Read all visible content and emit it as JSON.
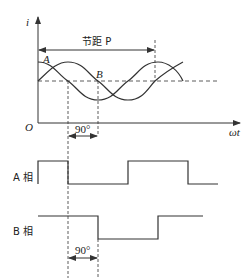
{
  "diagram": {
    "waveform_plot": {
      "y_axis_label": "i",
      "x_axis_label": "ωt",
      "origin_label": "O",
      "pitch_label": "节距 P",
      "curve_a_label": "A",
      "curve_b_label": "B",
      "phase_shift_label": "90°"
    },
    "square_waves": {
      "phase_a_label": "A 相",
      "phase_b_label": "B 相",
      "phase_shift_label": "90°"
    },
    "colors": {
      "line": "#333333",
      "background": "#ffffff"
    }
  }
}
